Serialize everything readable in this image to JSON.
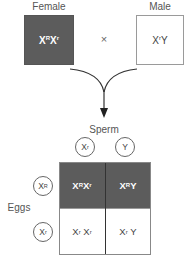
{
  "parents": {
    "female": {
      "label": "Female",
      "genotype": {
        "base1": "X",
        "sup1": "R",
        "base2": "X",
        "sup2": "r"
      },
      "color": "#5c5c5c"
    },
    "cross_symbol": "×",
    "male": {
      "label": "Male",
      "genotype": {
        "base1": "X",
        "sup1": "r",
        "base2": "Y",
        "sup2": ""
      },
      "color": "#ffffff"
    }
  },
  "punnett": {
    "sperm_label": "Sperm",
    "eggs_label": "Eggs",
    "sperm": [
      {
        "base": "X",
        "sup": "r"
      },
      {
        "base": "Y",
        "sup": ""
      }
    ],
    "eggs": [
      {
        "base": "X",
        "sup": "R"
      },
      {
        "base": "X",
        "sup": "r"
      }
    ],
    "cells": [
      [
        {
          "base1": "X",
          "sup1": "R",
          "base2": "X",
          "sup2": "r",
          "shade": "dark"
        },
        {
          "base1": "X",
          "sup1": "R",
          "base2": "Y",
          "sup2": "",
          "shade": "dark"
        }
      ],
      [
        {
          "base1": "X",
          "sup1": "r",
          "base2": "X",
          "sup2": "r",
          "shade": "light"
        },
        {
          "base1": "X",
          "sup1": "r",
          "base2": "Y",
          "sup2": "",
          "shade": "light"
        }
      ]
    ]
  },
  "colors": {
    "dark_fill": "#5c5c5c",
    "light_fill": "#ffffff",
    "line": "#333333"
  }
}
